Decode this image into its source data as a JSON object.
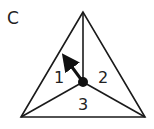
{
  "panel": {
    "label": "C"
  },
  "diagram": {
    "vertices": {
      "top": [
        83,
        12
      ],
      "bottom_left": [
        21,
        117
      ],
      "bottom_right": [
        145,
        117
      ],
      "center": [
        83,
        82
      ]
    },
    "regions": [
      {
        "id": "1",
        "label": "1"
      },
      {
        "id": "2",
        "label": "2"
      },
      {
        "id": "3",
        "label": "3"
      }
    ],
    "center_dot": {
      "radius": 5
    },
    "arrow": {
      "from": [
        83,
        82
      ],
      "to": [
        64,
        57
      ]
    },
    "colors": {
      "stroke": "#1a1a1a",
      "dot": "#111111",
      "background": "#ffffff"
    }
  }
}
